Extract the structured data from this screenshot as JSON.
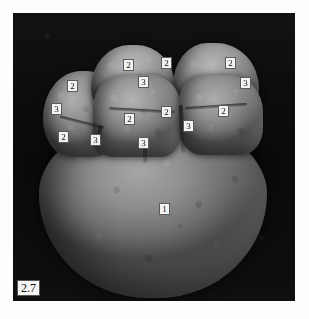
{
  "figure": {
    "number": "2.7",
    "image_type": "sem-micrograph",
    "background_color": "#0c0c0c",
    "page_background": "#ffffff"
  },
  "annotations": [
    {
      "id": "anno-2-top-left",
      "label": "2",
      "x": 110,
      "y": 46,
      "target": "cusp-top-left-crown"
    },
    {
      "id": "anno-2-top-center",
      "label": "2",
      "x": 148,
      "y": 44,
      "target": "cusp-top-left-crown-distal"
    },
    {
      "id": "anno-2-top-right",
      "label": "2",
      "x": 212,
      "y": 44,
      "target": "cusp-top-right-crown"
    },
    {
      "id": "anno-3-top-center",
      "label": "3",
      "x": 125,
      "y": 63,
      "target": "fissure-top-center"
    },
    {
      "id": "anno-3-top-right",
      "label": "3",
      "x": 227,
      "y": 64,
      "target": "fissure-top-right"
    },
    {
      "id": "anno-2-left-upper",
      "label": "2",
      "x": 54,
      "y": 67,
      "target": "cusp-left-crown"
    },
    {
      "id": "anno-3-left",
      "label": "3",
      "x": 38,
      "y": 90,
      "target": "fissure-left"
    },
    {
      "id": "anno-2-center-left",
      "label": "2",
      "x": 111,
      "y": 100,
      "target": "cusp-center-crown"
    },
    {
      "id": "anno-2-center-right",
      "label": "2",
      "x": 148,
      "y": 93,
      "target": "cusp-center-crown-distal"
    },
    {
      "id": "anno-2-right",
      "label": "2",
      "x": 205,
      "y": 92,
      "target": "cusp-right-crown"
    },
    {
      "id": "anno-3-right-mid",
      "label": "3",
      "x": 170,
      "y": 107,
      "target": "fissure-right-mid"
    },
    {
      "id": "anno-2-left-lower",
      "label": "2",
      "x": 45,
      "y": 118,
      "target": "cusp-left-crown-lower"
    },
    {
      "id": "anno-3-left-lower",
      "label": "3",
      "x": 77,
      "y": 121,
      "target": "fissure-left-lower"
    },
    {
      "id": "anno-3-bottom-center",
      "label": "3",
      "x": 125,
      "y": 124,
      "target": "fissure-bottom-center"
    },
    {
      "id": "anno-1-body",
      "label": "1",
      "x": 146,
      "y": 190,
      "target": "specimen-main-body"
    }
  ]
}
